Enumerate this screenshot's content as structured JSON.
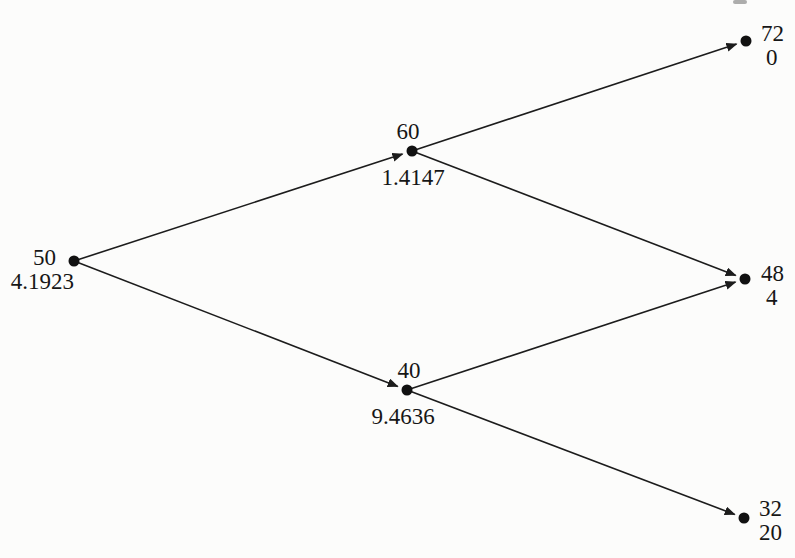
{
  "diagram": {
    "type": "binomial-tree",
    "colors": {
      "ink": "#1c1c1c",
      "paper": "#fcfcfb"
    },
    "nodes": [
      {
        "id": "root",
        "price": "50",
        "value": "4.1923"
      },
      {
        "id": "up",
        "price": "60",
        "value": "1.4147"
      },
      {
        "id": "down",
        "price": "40",
        "value": "9.4636"
      },
      {
        "id": "up-up",
        "price": "72",
        "value": "0"
      },
      {
        "id": "middle",
        "price": "48",
        "value": "4"
      },
      {
        "id": "down-down",
        "price": "32",
        "value": "20"
      }
    ],
    "edges": [
      {
        "from": "root",
        "to": "up"
      },
      {
        "from": "root",
        "to": "down"
      },
      {
        "from": "up",
        "to": "up-up"
      },
      {
        "from": "up",
        "to": "middle"
      },
      {
        "from": "down",
        "to": "middle"
      },
      {
        "from": "down",
        "to": "down-down"
      }
    ]
  }
}
